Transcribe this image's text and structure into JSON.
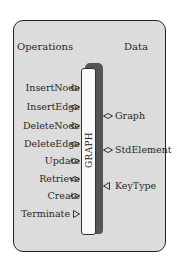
{
  "headers": {
    "operations": "Operations",
    "data": "Data"
  },
  "module": {
    "name": "GRAPH"
  },
  "operations": [
    {
      "label": "InsertNode",
      "icon": "diamond-icon"
    },
    {
      "label": "InsertEdge",
      "icon": "diamond-icon"
    },
    {
      "label": "DeleteNode",
      "icon": "diamond-icon"
    },
    {
      "label": "DeleteEdge",
      "icon": "diamond-icon"
    },
    {
      "label": "Update",
      "icon": "diamond-icon"
    },
    {
      "label": "Retrieve",
      "icon": "diamond-icon"
    },
    {
      "label": "Create",
      "icon": "diamond-icon"
    },
    {
      "label": "Terminate",
      "icon": "triangle-right-icon"
    }
  ],
  "data": [
    {
      "label": "Graph",
      "icon": "diamond-icon"
    },
    {
      "label": "StdElement",
      "icon": "diamond-icon"
    },
    {
      "label": "KeyType",
      "icon": "triangle-left-icon"
    }
  ]
}
